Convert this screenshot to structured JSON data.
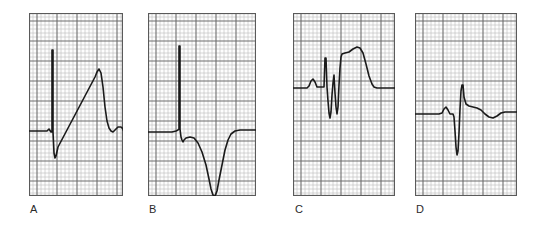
{
  "figure": {
    "background_color": "#ffffff",
    "width": 541,
    "height": 229,
    "grid": {
      "minor_color": "#b9b9b9",
      "major_color": "#6e6e6e",
      "border_color": "#5a5a5a",
      "minor_step_px": 4,
      "major_every": 5,
      "paper_color": "#fdfdfd"
    },
    "trace_color": "#1a1a1a"
  },
  "panels": [
    {
      "id": "panel-a",
      "label": "A",
      "x": 29,
      "y": 13,
      "width": 94,
      "height": 183,
      "label_x": 30,
      "label_y": 204,
      "baseline_y": 118,
      "description": "Wide upright QRS with slurred upstroke and tall R wave",
      "cols": 23,
      "rows": 45,
      "major_offset_x": 2,
      "major_offset_y": 2,
      "trace": "M 0,118 L 18,118 L 20,116 L 22,119 L 23,119 L 23,37 L 24,37 L 24,119 L 25,140 L 26,145 L 27,143 L 29,134 L 66,64 L 68,59 L 70,56 L 72,60 L 74,74 L 76,94 L 78,108 L 80,115 L 82,118 L 84,119 L 86,117 L 89,114 L 92,114 L 94,116 L 94,117"
    },
    {
      "id": "panel-b",
      "label": "B",
      "x": 148,
      "y": 13,
      "width": 108,
      "height": 183,
      "label_x": 149,
      "label_y": 204,
      "baseline_y": 118,
      "description": "Narrow tall R spike followed by deep wide negative S-T deflection",
      "cols": 27,
      "rows": 45,
      "major_offset_x": 2,
      "major_offset_y": 2,
      "trace": "M 0,119 L 24,119 L 28,118 L 30,117 L 31,116 L 31,33 L 32,33 L 32,116 L 33,124 L 34,127 L 35,129 L 36,127 L 38,125 L 42,124 L 46,125 L 50,130 L 54,139 L 58,152 L 61,166 L 63,176 L 65,182 L 67,183 L 69,178 L 71,167 L 74,152 L 77,137 L 80,127 L 83,121 L 87,118 L 92,117 L 100,117 L 108,117"
    },
    {
      "id": "panel-c",
      "label": "C",
      "x": 293,
      "y": 13,
      "width": 102,
      "height": 183,
      "label_x": 295,
      "label_y": 204,
      "baseline_y": 74,
      "description": "P wave, rSR prime complex with deep S, elevated domed ST segment",
      "cols": 25,
      "rows": 45,
      "major_offset_x": 2,
      "major_offset_y": 2,
      "trace": "M 0,75 L 14,75 L 16,73 L 18,68 L 20,66 L 22,69 L 24,74 L 30,74 L 31,74 L 32,45 L 33,45 L 34,74 L 35,88 L 36,100 L 37,105 L 38,99 L 39,82 L 40,70 L 41,62 L 42,80 L 43,94 L 44,101 L 45,94 L 46,72 L 47,55 L 48,44 L 49,41 L 52,40 L 56,39 L 60,36 L 64,34 L 67,35 L 70,40 L 73,51 L 76,63 L 79,71 L 81,74 L 84,75 L 90,75 L 96,75 L 102,75"
    },
    {
      "id": "panel-d",
      "label": "D",
      "x": 415,
      "y": 13,
      "width": 102,
      "height": 183,
      "label_x": 416,
      "label_y": 204,
      "baseline_y": 101,
      "description": "Small P wave, narrow tall QRS with deep Q wave and slight ST depression",
      "cols": 25,
      "rows": 45,
      "major_offset_x": 2,
      "major_offset_y": 2,
      "trace": "M 0,101 L 24,101 L 27,100 L 29,96 L 31,94 L 33,97 L 35,101 L 38,101 L 39,104 L 40,118 L 41,134 L 42,142 L 43,138 L 44,120 L 45,96 L 46,78 L 47,72 L 48,72 L 49,84 L 51,91 L 54,93 L 58,94 L 62,95 L 66,97 L 70,101 L 74,104 L 78,105 L 82,103 L 86,100 L 90,99 L 95,99 L 102,99"
    }
  ]
}
